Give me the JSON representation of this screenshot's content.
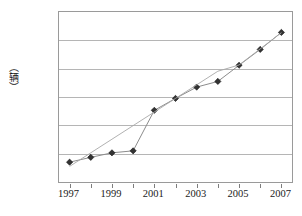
{
  "chart_data": {
    "type": "line",
    "title": "",
    "subtitle": "",
    "xlabel": "",
    "ylabel": "（辆）",
    "x": [
      1997,
      1998,
      1999,
      2000,
      2001,
      2002,
      2003,
      2004,
      2005,
      2006,
      2007
    ],
    "categories": [
      "1997",
      "1998",
      "1999",
      "2000",
      "2001",
      "2002",
      "2003",
      "2004",
      "2005",
      "2006",
      "2007"
    ],
    "series": [
      {
        "name": "data",
        "values": [
          70000,
          87000,
          103000,
          110000,
          253000,
          295000,
          335000,
          355000,
          412000,
          468000,
          528000
        ],
        "marker": "diamond",
        "marker_color": "#333333",
        "line_color": "#8c8c8c"
      },
      {
        "name": "trendline",
        "values": [
          55000,
          103000,
          151000,
          199000,
          247000,
          295000,
          343000,
          391000,
          413000,
          470000,
          527000
        ],
        "marker": "none",
        "line_color": "#a8a8a8"
      }
    ],
    "ylim": [
      0,
      600000
    ],
    "yticks": [
      0,
      100000,
      200000,
      300000,
      400000,
      500000,
      600000
    ],
    "ytick_labels": [
      "0",
      "100 000",
      "200 000",
      "300 000",
      "400 000",
      "500 000",
      "600 000"
    ],
    "xticks": [
      1997,
      1998,
      1999,
      2000,
      2001,
      2002,
      2003,
      2004,
      2005,
      2006,
      2007
    ],
    "xtick_labels_shown": [
      "1997",
      "1999",
      "2001",
      "2003",
      "2005",
      "2007"
    ],
    "xlim": [
      1996.5,
      2007.5
    ],
    "grid": "horizontal",
    "legend": "none",
    "plot_background": "#ffffff",
    "grid_color": "#b5b5b5",
    "frame_color": "#9a9a9a"
  }
}
